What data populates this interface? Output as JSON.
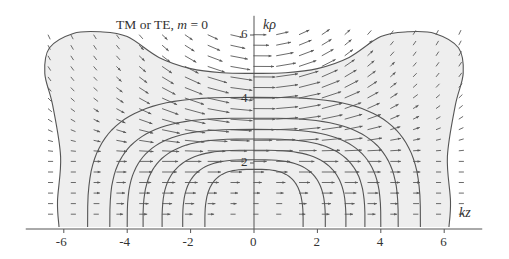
{
  "chart_data": {
    "type": "vector-field-contour",
    "title": "TM or TE, m = 0",
    "title_parts": {
      "prefix": "TM or TE, ",
      "var": "m",
      "suffix": " = 0"
    },
    "xlabel": "kz",
    "ylabel": "kρ",
    "xlim": [
      -7.2,
      7.2
    ],
    "ylim": [
      0,
      6.6
    ],
    "x_ticks": [
      -6,
      -4,
      -2,
      0,
      2,
      4,
      6
    ],
    "x_tick_labels": [
      "-6",
      "-4",
      "-2",
      "0",
      "2",
      "4",
      "6"
    ],
    "y_ticks": [
      2,
      4,
      6
    ],
    "y_tick_labels": [
      "2",
      "4",
      "6"
    ],
    "grid": false,
    "colors": {
      "axis": "#555555",
      "contour": "#555555",
      "arrow": "#5a5a5a",
      "shade": "#eeeeee"
    },
    "contours": [
      {
        "z_half_width": 1.55,
        "top_rho": 1.8
      },
      {
        "z_half_width": 2.25,
        "top_rho": 2.1
      },
      {
        "z_half_width": 2.9,
        "top_rho": 2.4
      },
      {
        "z_half_width": 3.5,
        "top_rho": 2.75
      },
      {
        "z_half_width": 4.0,
        "top_rho": 3.05
      },
      {
        "z_half_width": 4.55,
        "top_rho": 3.4
      },
      {
        "z_half_width": 5.25,
        "top_rho": 4.05
      }
    ],
    "outer_contour": {
      "z_base": 6.15,
      "z_max": 6.6,
      "peak_z": 4.85,
      "peak_rho": 6.1,
      "center_rho": 4.8,
      "waist_z": 6.1,
      "waist_rho": 3.2
    },
    "arrow_grid": {
      "z_step": 0.72,
      "rho_step": 0.33,
      "z_range": [
        -6.5,
        6.5
      ],
      "rho_range": [
        0.4,
        6.3
      ]
    }
  }
}
